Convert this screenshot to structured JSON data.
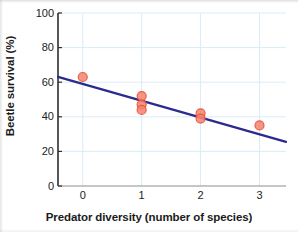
{
  "chart_data": {
    "type": "scatter",
    "title": "",
    "xlabel": "Predator diversity (number of species)",
    "ylabel": "Beetle survival (%)",
    "xlim": [
      -0.42,
      3.45
    ],
    "ylim": [
      0,
      100
    ],
    "xticks": [
      0,
      1,
      2,
      3
    ],
    "xtick_labels": [
      "0",
      "1",
      "2",
      "3"
    ],
    "yticks": [
      0,
      20,
      40,
      60,
      80,
      100
    ],
    "ytick_labels": [
      "0",
      "20",
      "40",
      "60",
      "80",
      "100"
    ],
    "grid": true,
    "grid_color": "#d9ecf5",
    "legend": "none",
    "points": [
      {
        "x": 0,
        "y": 63
      },
      {
        "x": 1,
        "y": 52
      },
      {
        "x": 1,
        "y": 47
      },
      {
        "x": 1,
        "y": 44
      },
      {
        "x": 2,
        "y": 42
      },
      {
        "x": 2,
        "y": 39
      },
      {
        "x": 3,
        "y": 35
      }
    ],
    "marker": {
      "shape": "circle",
      "fill": "#f4836f",
      "edge": "#e8543c",
      "size": 9,
      "opacity": 0.85
    },
    "trendline": {
      "type": "linear-fit",
      "color": "#2b2b8f",
      "width": 2.2,
      "intercept": 59.0,
      "slope": -9.7,
      "x_start": -0.42,
      "y_start": 63.1,
      "x_end": 3.45,
      "y_end": 25.5
    }
  }
}
